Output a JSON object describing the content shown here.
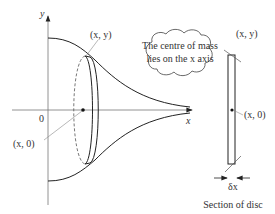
{
  "diagram": {
    "axes": {
      "y_label": "y",
      "x_label": "x",
      "origin_label": "0"
    },
    "labels": {
      "point_top": "(x, y)",
      "point_axis": "(x, 0)",
      "section_point_top": "(x, y)",
      "section_point_axis": "(x, 0)",
      "thickness": "δx",
      "section_caption": "Section of disc"
    },
    "callout": {
      "line1": "The centre of mass",
      "line2": "lies on the x axis"
    },
    "colors": {
      "line": "#222222",
      "leader": "#777777",
      "text": "#333333"
    }
  }
}
